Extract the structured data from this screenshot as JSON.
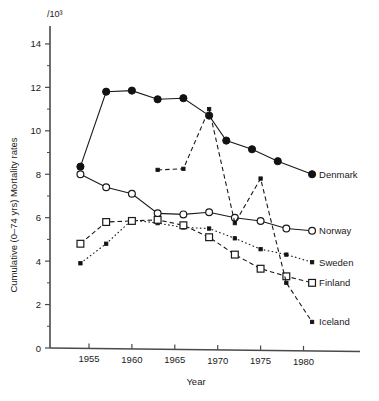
{
  "chart_data": {
    "type": "line",
    "title": "",
    "xlabel": "Year",
    "ylabel": "Cumulative (0–74 yrs) Mortality rates",
    "unit_label": "/10³",
    "xlim": [
      1953,
      1983
    ],
    "ylim": [
      0,
      15
    ],
    "xticks": [
      1955,
      1960,
      1965,
      1970,
      1975,
      1980
    ],
    "xtick_labels": [
      "1955",
      "1960",
      "1965",
      "1970",
      "1975",
      "1980"
    ],
    "yticks": [
      0,
      2,
      4,
      6,
      8,
      10,
      12,
      14
    ],
    "ytick_labels": [
      "0",
      "2",
      "4",
      "6",
      "8",
      "10",
      "12",
      "14"
    ],
    "yticks_minor": [
      1,
      3,
      5,
      7,
      9,
      11,
      13,
      15
    ],
    "grid": false,
    "legend_position": "right-inline-labels",
    "series": [
      {
        "name": "Denmark",
        "label": "Denmark",
        "marker": "filled-circle",
        "linestyle": "solid",
        "x": [
          1954,
          1957,
          1960,
          1963,
          1966,
          1969,
          1971,
          1974,
          1977,
          1981
        ],
        "y": [
          8.35,
          11.8,
          11.85,
          11.45,
          11.5,
          10.7,
          9.55,
          9.15,
          8.6,
          8.0
        ]
      },
      {
        "name": "Norway",
        "label": "Norway",
        "marker": "open-circle",
        "linestyle": "solid",
        "x": [
          1954,
          1957,
          1960,
          1963,
          1966,
          1969,
          1972,
          1975,
          1978,
          1981
        ],
        "y": [
          8.0,
          7.4,
          7.1,
          6.2,
          6.15,
          6.25,
          6.0,
          5.85,
          5.5,
          5.4
        ]
      },
      {
        "name": "Sweden",
        "label": "Sweden",
        "marker": "small-filled",
        "linestyle": "dotted",
        "x": [
          1954,
          1957,
          1960,
          1963,
          1966,
          1969,
          1972,
          1975,
          1978,
          1981
        ],
        "y": [
          3.9,
          4.8,
          5.9,
          5.75,
          5.55,
          5.5,
          5.05,
          4.55,
          4.3,
          3.95
        ]
      },
      {
        "name": "Finland",
        "label": "Finland",
        "marker": "open-square",
        "linestyle": "dashed",
        "x": [
          1954,
          1957,
          1960,
          1963,
          1966,
          1969,
          1972,
          1975,
          1978,
          1981
        ],
        "y": [
          4.8,
          5.8,
          5.85,
          5.9,
          5.65,
          5.1,
          4.3,
          3.65,
          3.3,
          3.0
        ]
      },
      {
        "name": "Iceland",
        "label": "Iceland",
        "marker": "small-filled",
        "linestyle": "dashed",
        "x": [
          1963,
          1966,
          1969,
          1972,
          1975,
          1978,
          1981
        ],
        "y": [
          8.2,
          8.25,
          11.0,
          5.75,
          7.8,
          3.0,
          1.2
        ]
      }
    ]
  }
}
